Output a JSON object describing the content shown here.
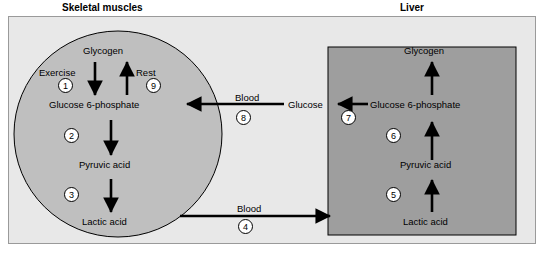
{
  "diagram": {
    "title_left": "Skeletal muscles",
    "title_right": "Liver",
    "labels": {
      "glycogen_left": "Glycogen",
      "glycogen_right": "Glycogen",
      "exercise": "Exercise",
      "rest": "Rest",
      "g6p_left": "Glucose 6-phosphate",
      "g6p_right": "Glucose 6-phosphate",
      "pyruvic_left": "Pyruvic acid",
      "pyruvic_right": "Pyruvic acid",
      "lactic_left": "Lactic acid",
      "lactic_right": "Lactic acid",
      "blood_top": "Blood",
      "blood_bottom": "Blood",
      "glucose": "Glucose"
    },
    "steps": {
      "s1": "1",
      "s2": "2",
      "s3": "3",
      "s4": "4",
      "s5": "5",
      "s6": "6",
      "s7": "7",
      "s8": "8",
      "s9": "9"
    },
    "colors": {
      "panel_background": "#e8e8e8",
      "muscle_ellipse": "#bfbfbf",
      "liver_rect": "#9e9e9e",
      "stroke": "#000000",
      "page_background": "#ffffff"
    }
  }
}
